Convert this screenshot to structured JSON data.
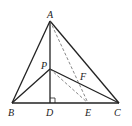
{
  "diagram": {
    "type": "geometry-triangle",
    "points": {
      "A": {
        "label": "A",
        "x": 50,
        "y": 21,
        "lx": 47,
        "ly": 18
      },
      "B": {
        "label": "B",
        "x": 12,
        "y": 103,
        "lx": 8,
        "ly": 116
      },
      "C": {
        "label": "C",
        "x": 119,
        "y": 103,
        "lx": 114,
        "ly": 116
      },
      "D": {
        "label": "D",
        "x": 50,
        "y": 103,
        "lx": 46,
        "ly": 116
      },
      "E": {
        "label": "E",
        "x": 88,
        "y": 103,
        "lx": 85,
        "ly": 116
      },
      "P": {
        "label": "P",
        "x": 50,
        "y": 69,
        "lx": 41,
        "ly": 69
      },
      "F": {
        "label": "F",
        "x": 80,
        "y": 83,
        "lx": 80,
        "ly": 80
      }
    },
    "solid_segments": [
      [
        "A",
        "B"
      ],
      [
        "A",
        "C"
      ],
      [
        "B",
        "C"
      ],
      [
        "A",
        "D"
      ],
      [
        "P",
        "B"
      ],
      [
        "P",
        "C"
      ]
    ],
    "dashed_segments": [
      [
        "A",
        "E"
      ],
      [
        "P",
        "E"
      ]
    ],
    "right_angle_marker": {
      "at": "D",
      "size": 5
    },
    "colors": {
      "line": "#222222",
      "dashed": "#555555",
      "background": "#ffffff"
    }
  }
}
